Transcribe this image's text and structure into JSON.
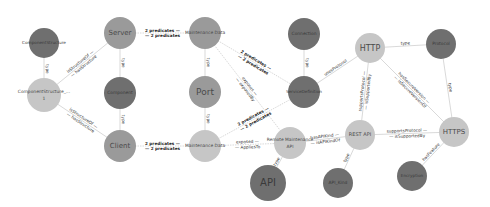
{
  "graph": {
    "colors": {
      "dark": "#6f6f6f",
      "medium": "#9a9a9a",
      "light": "#c6c6c6",
      "edge": "#c8c8c8",
      "text_dark": "#3a3a3a",
      "text_light": "#4a4a4a"
    },
    "nodes": [
      {
        "id": "n1",
        "label": "ComponentStructure",
        "x": 44,
        "y": 43,
        "r": 15,
        "shade": "dark",
        "fs": 4.2
      },
      {
        "id": "n2",
        "label": "ComponentStructure_...",
        "label2": "1",
        "x": 44,
        "y": 95,
        "r": 17,
        "shade": "light",
        "fs": 4.4
      },
      {
        "id": "n3",
        "label": "Server",
        "x": 120,
        "y": 33,
        "r": 16,
        "shade": "medium",
        "fs": 7
      },
      {
        "id": "n4",
        "label": "Component",
        "x": 120,
        "y": 93,
        "r": 16,
        "shade": "dark",
        "fs": 4.4
      },
      {
        "id": "n5",
        "label": "Client",
        "x": 120,
        "y": 146,
        "r": 16,
        "shade": "medium",
        "fs": 7
      },
      {
        "id": "n6",
        "label": "Maintenance Data",
        "x": 205,
        "y": 33,
        "r": 16,
        "shade": "medium",
        "fs": 4.4
      },
      {
        "id": "n7",
        "label": "Port",
        "x": 205,
        "y": 92,
        "r": 16,
        "shade": "medium",
        "fs": 9
      },
      {
        "id": "n8",
        "label": "Maintenance Data",
        "x": 205,
        "y": 146,
        "r": 16,
        "shade": "light",
        "fs": 4.4
      },
      {
        "id": "n9",
        "label": "Connection",
        "x": 304,
        "y": 34,
        "r": 16,
        "shade": "dark",
        "fs": 4.4
      },
      {
        "id": "n10",
        "label": "ServiceDefinition",
        "x": 304,
        "y": 92,
        "r": 16,
        "shade": "dark",
        "fs": 4.2
      },
      {
        "id": "n11",
        "label": "Remote Maintenance",
        "label2": "API",
        "x": 290,
        "y": 143,
        "r": 16,
        "shade": "light",
        "fs": 4.4
      },
      {
        "id": "n12",
        "label": "API",
        "x": 268,
        "y": 183,
        "r": 18,
        "shade": "dark",
        "fs": 10
      },
      {
        "id": "n13",
        "label": "HTTP",
        "x": 370,
        "y": 48,
        "r": 15,
        "shade": "light",
        "fs": 8
      },
      {
        "id": "n14",
        "label": "Protocol",
        "x": 441,
        "y": 44,
        "r": 15,
        "shade": "dark",
        "fs": 4.4
      },
      {
        "id": "n15",
        "label": "REST API",
        "x": 360,
        "y": 135,
        "r": 15,
        "shade": "light",
        "fs": 5
      },
      {
        "id": "n16",
        "label": "HTTPS",
        "x": 454,
        "y": 132,
        "r": 15,
        "shade": "light",
        "fs": 7
      },
      {
        "id": "n17",
        "label": "API_Kind",
        "x": 338,
        "y": 183,
        "r": 15,
        "shade": "dark",
        "fs": 4.4
      },
      {
        "id": "n18",
        "label": "Encryption",
        "x": 412,
        "y": 176,
        "r": 15,
        "shade": "dark",
        "fs": 4.2
      }
    ],
    "edges": [
      {
        "from": "n1",
        "to": "n2",
        "label": "type",
        "dashed": false
      },
      {
        "from": "n2",
        "to": "n3",
        "label": "isStructureOf",
        "label2": "hasStructure",
        "dashed": false
      },
      {
        "from": "n2",
        "to": "n5",
        "label": "isStructureOf",
        "label2": "hasStructure",
        "dashed": false
      },
      {
        "from": "n3",
        "to": "n4",
        "label": "type",
        "dashed": false
      },
      {
        "from": "n4",
        "to": "n5",
        "label": "type",
        "dashed": false
      },
      {
        "from": "n3",
        "to": "n6",
        "label": "2 predicates",
        "label2": "2 predicates",
        "bold": true,
        "dashed": true
      },
      {
        "from": "n5",
        "to": "n8",
        "label": "2 predicates",
        "label2": "2 predicates",
        "bold": true,
        "dashed": true
      },
      {
        "from": "n6",
        "to": "n7",
        "label": "type",
        "dashed": false
      },
      {
        "from": "n7",
        "to": "n8",
        "label": "type",
        "dashed": false
      },
      {
        "from": "n6",
        "to": "n10",
        "label": "2 predicates",
        "label2": "2 predicates",
        "bold": true,
        "dashed": true
      },
      {
        "from": "n6",
        "to": "n11",
        "label": "exposes",
        "label2": "exposedBy",
        "dashed": true
      },
      {
        "from": "n8",
        "to": "n10",
        "label": "2 predicates",
        "label2": "2 predicates",
        "bold": true,
        "dashed": true
      },
      {
        "from": "n8",
        "to": "n11",
        "label": "exposed",
        "label2": "AppliesTo",
        "dashed": true
      },
      {
        "from": "n9",
        "to": "n10",
        "label": "type",
        "dashed": false
      },
      {
        "from": "n10",
        "to": "n13",
        "label": "usesProtocol",
        "dashed": false
      },
      {
        "from": "n11",
        "to": "n12",
        "label": "type",
        "dashed": false
      },
      {
        "from": "n11",
        "to": "n15",
        "label": "hasAPIKind",
        "label2": "isAPIKindOf",
        "dashed": false
      },
      {
        "from": "n13",
        "to": "n14",
        "label": "type",
        "dashed": false
      },
      {
        "from": "n13",
        "to": "n15",
        "label": "supportsProtocol",
        "label2": "isSupportedBy",
        "dashed": false
      },
      {
        "from": "n13",
        "to": "n16",
        "label": "hasSecureVersion",
        "label2": "isSecureVersionOf",
        "dashed": false
      },
      {
        "from": "n14",
        "to": "n16",
        "label": "type",
        "dashed": false
      },
      {
        "from": "n15",
        "to": "n16",
        "label": "supportsProtocol",
        "label2": "isSupportedBy",
        "dashed": false
      },
      {
        "from": "n15",
        "to": "n17",
        "label": "type",
        "dashed": false
      },
      {
        "from": "n16",
        "to": "n18",
        "label": "hasFeature",
        "dashed": false
      }
    ]
  }
}
